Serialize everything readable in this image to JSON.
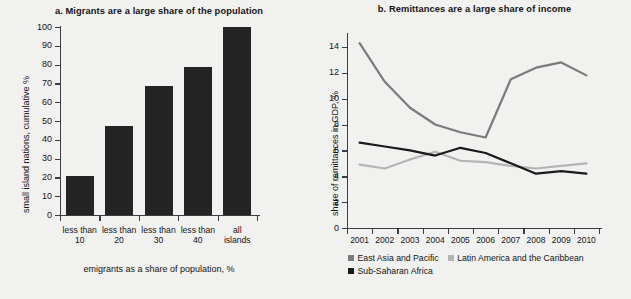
{
  "chart_data": [
    {
      "type": "bar",
      "panel_letter": "a.",
      "title": "a.  Migrants are a large share of the population",
      "categories": [
        "less than\n10",
        "less than\n20",
        "less than\n30",
        "less than\n40",
        "all\nislands"
      ],
      "category_lines": [
        [
          "less than",
          "10"
        ],
        [
          "less than",
          "20"
        ],
        [
          "less than",
          "30"
        ],
        [
          "less than",
          "40"
        ],
        [
          "all",
          "islands"
        ]
      ],
      "values": [
        21,
        47.5,
        68.5,
        79,
        100
      ],
      "xlabel": "emigrants as a share of population, %",
      "ylabel": "small island nations, cumulative %",
      "ylim": [
        0,
        100
      ],
      "ytick_labels": [
        "100",
        "90",
        "80",
        "70",
        "60",
        "50",
        "40",
        "30",
        "20",
        "10",
        "0"
      ],
      "ytick_values": [
        100,
        90,
        80,
        70,
        60,
        50,
        40,
        30,
        20,
        10,
        0
      ],
      "grid": false,
      "bar_color": "#242424"
    },
    {
      "type": "line",
      "panel_letter": "b.",
      "title": "b.  Remittances are a large share of income",
      "x": [
        "2001",
        "2002",
        "2003",
        "2004",
        "2005",
        "2006",
        "2007",
        "2008",
        "2009",
        "2010"
      ],
      "series": [
        {
          "name": "East Asia and Pacific",
          "color": "#7b7b7b",
          "values": [
            14.3,
            11.3,
            9.3,
            8.0,
            7.4,
            7.0,
            11.5,
            12.4,
            12.8,
            11.8
          ]
        },
        {
          "name": "Latin America and the Caribbean",
          "color": "#b4b4b4",
          "values": [
            4.9,
            4.6,
            5.3,
            5.9,
            5.2,
            5.1,
            4.8,
            4.6,
            4.8,
            5.0
          ]
        },
        {
          "name": "Sub-Saharan Africa",
          "color": "#1a1a1a",
          "values": [
            6.6,
            6.3,
            6.0,
            5.6,
            6.2,
            5.8,
            5.0,
            4.2,
            4.4,
            4.2
          ]
        }
      ],
      "xlabel": "",
      "ylabel": "share of remittances in GDP, %",
      "ylim": [
        0,
        15
      ],
      "ytick_labels": [
        "14",
        "12",
        "10",
        "8",
        "6",
        "4",
        "2",
        "0"
      ],
      "ytick_values": [
        14,
        12,
        10,
        8,
        6,
        4,
        2,
        0
      ],
      "grid": false,
      "legend_position": "bottom-left"
    }
  ],
  "colors": {
    "background": "#f1f1f0",
    "axis": "#3c3c46",
    "text": "#141414"
  }
}
